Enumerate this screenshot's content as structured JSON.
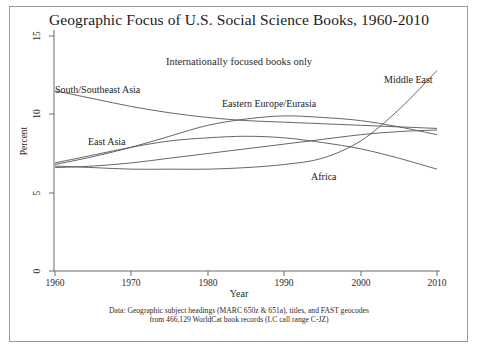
{
  "figure": {
    "title": "Geographic Focus of U.S. Social Science Books, 1960-2010",
    "subtitle": "Internationally focused books only",
    "footnote_line1": "Data: Geographic subject headings (MARC 650z & 651a), titles, and FAST geocodes",
    "footnote_line2": "from 466,129 WorldCat book records (LC call range C-JZ)",
    "frame_color": "#9a9a9a",
    "line_color": "#555555",
    "axis_color": "#6b6b6b"
  },
  "axes": {
    "ylabel": "Percent",
    "xlabel": "Year",
    "yticks": [
      "0",
      "5",
      "10",
      "15"
    ],
    "xticks": [
      "1960",
      "1970",
      "1980",
      "1990",
      "2000",
      "2010"
    ]
  },
  "labels": {
    "south_southeast_asia": "South/Southeast Asia",
    "eastern_europe_eurasia": "Eastern Europe/Eurasia",
    "east_asia": "East Asia",
    "africa": "Africa",
    "middle_east": "Middle East"
  },
  "chart_data": {
    "type": "line",
    "title": "Geographic Focus of U.S. Social Science Books, 1960-2010",
    "subtitle": "Internationally focused books only",
    "xlabel": "Year",
    "ylabel": "Percent",
    "xlim": [
      1960,
      2010
    ],
    "ylim": [
      0,
      15
    ],
    "yticks": [
      0,
      5,
      10,
      15
    ],
    "xticks": [
      1960,
      1970,
      1980,
      1990,
      2000,
      2010
    ],
    "grid": false,
    "legend": "inline-annotations",
    "x": [
      1960,
      1965,
      1970,
      1975,
      1980,
      1985,
      1990,
      1995,
      2000,
      2005,
      2010
    ],
    "series": [
      {
        "name": "South/Southeast Asia",
        "values": [
          11.5,
          11.0,
          10.5,
          10.1,
          9.8,
          9.6,
          9.5,
          9.4,
          9.3,
          9.2,
          9.1
        ]
      },
      {
        "name": "Eastern Europe/Eurasia",
        "values": [
          6.8,
          7.3,
          7.9,
          8.6,
          9.3,
          9.7,
          9.9,
          9.8,
          9.6,
          9.2,
          8.7
        ]
      },
      {
        "name": "East Asia",
        "values": [
          6.6,
          6.7,
          6.9,
          7.2,
          7.5,
          7.8,
          8.1,
          8.4,
          8.7,
          8.9,
          9.0
        ]
      },
      {
        "name": "Africa",
        "values": [
          6.9,
          7.4,
          7.9,
          8.3,
          8.5,
          8.6,
          8.5,
          8.2,
          7.8,
          7.2,
          6.5
        ]
      },
      {
        "name": "Middle East",
        "values": [
          6.7,
          6.6,
          6.5,
          6.5,
          6.5,
          6.6,
          6.8,
          7.2,
          8.3,
          10.3,
          12.8
        ]
      }
    ]
  }
}
